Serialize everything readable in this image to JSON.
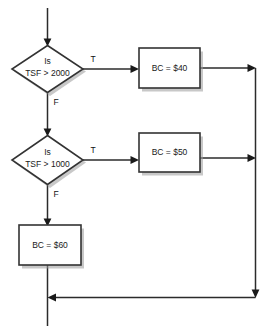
{
  "diagram": {
    "background_color": "#ffffff",
    "line_color": "#2b2b2b",
    "shape_stroke_color": "#333333",
    "shape_fill_color": "#ffffff",
    "shadow_color": "#9a9a9a",
    "text_color": "#1a1a1a"
  },
  "nodes": {
    "decision_1": {
      "type": "decision",
      "line_1": "Is",
      "line_2": "TSF > 2000"
    },
    "decision_2": {
      "type": "decision",
      "line_1": "Is",
      "line_2": "TSF > 1000"
    },
    "process_40": {
      "type": "process",
      "label": "BC = $40"
    },
    "process_50": {
      "type": "process",
      "label": "BC = $50"
    },
    "process_60": {
      "type": "process",
      "label": "BC = $60"
    }
  },
  "edge_labels": {
    "d1_true": "T",
    "d1_false": "F",
    "d2_true": "T",
    "d2_false": "F"
  }
}
